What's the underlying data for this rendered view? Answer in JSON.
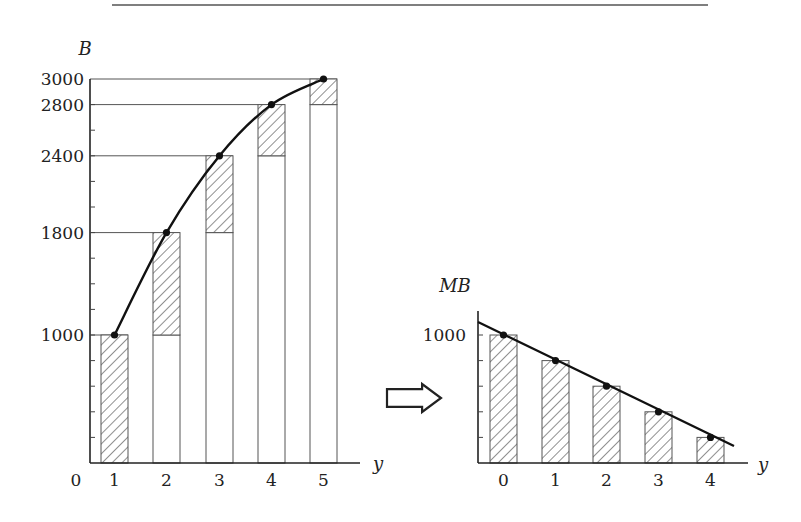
{
  "header_rule": {
    "x1": 112,
    "x2": 708,
    "y": 5
  },
  "arrow": {
    "label": "arrow-right",
    "x": 387,
    "y": 384,
    "w": 54,
    "h": 28
  },
  "chart_data": [
    {
      "type": "bar",
      "name": "total-benefit",
      "title": "",
      "ylabel": "B",
      "xlabel": "y",
      "origin_label": "0",
      "categories": [
        "1",
        "2",
        "3",
        "4",
        "5"
      ],
      "values": [
        1000,
        1800,
        2400,
        2800,
        3000
      ],
      "increments": [
        1000,
        800,
        600,
        400,
        200
      ],
      "yticks_labeled": [
        1000,
        1800,
        2400,
        2800,
        3000
      ],
      "yticks_minor_step": 200,
      "ylim": [
        0,
        3000
      ],
      "curve": "concave increasing through bar tops",
      "grid": false,
      "layout": {
        "x0": 90,
        "baseline": 463,
        "ytop": 79,
        "axis_end": 360,
        "bar_w": 27,
        "bar_starts": [
          101,
          153,
          206,
          258,
          310
        ],
        "ylabel_pos": [
          85,
          55
        ],
        "xlabel_pos": [
          378,
          470
        ]
      }
    },
    {
      "type": "bar",
      "name": "marginal-benefit",
      "title": "",
      "ylabel": "MB",
      "xlabel": "y",
      "categories": [
        "0",
        "1",
        "2",
        "3",
        "4"
      ],
      "values": [
        1000,
        800,
        600,
        400,
        200
      ],
      "yticks_labeled": [
        1000
      ],
      "yticks_minor_step": 200,
      "ylim": [
        0,
        1100
      ],
      "line": {
        "from": [
          -0.5,
          1100
        ],
        "to": [
          4.45,
          130
        ],
        "note": "straight downward-sloping line through bar tops"
      },
      "grid": false,
      "layout": {
        "x0": 478,
        "baseline": 463,
        "ytop": 311,
        "axis_end": 748,
        "bar_w": 27,
        "bar_starts": [
          490,
          542,
          593,
          645,
          697
        ],
        "ylabel_pos": [
          455,
          292
        ],
        "xlabel_pos": [
          763,
          471
        ],
        "line_start": [
          478,
          322
        ],
        "line_end": [
          734,
          446
        ]
      }
    }
  ]
}
